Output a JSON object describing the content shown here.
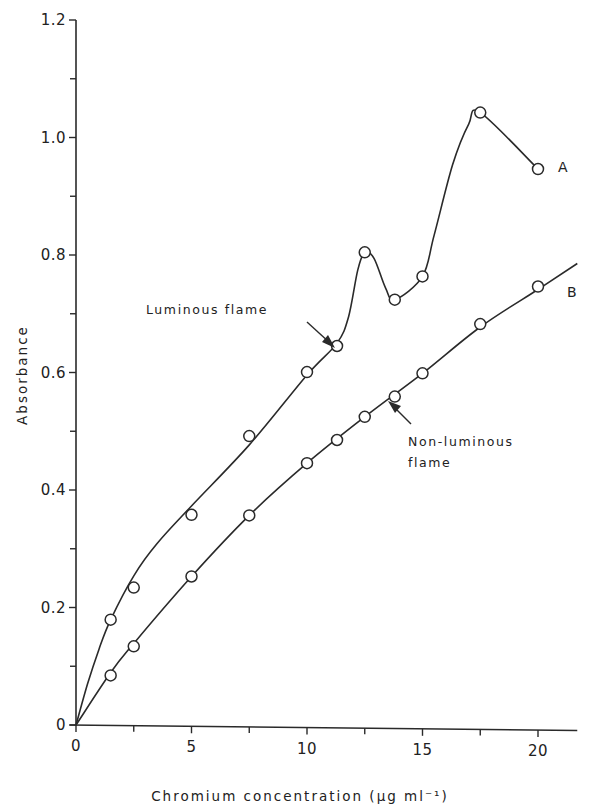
{
  "chart_data": {
    "type": "line",
    "title": "",
    "xlabel": "Chromium concentration (μg ml⁻¹)",
    "ylabel": "Absorbance",
    "xlim": [
      0,
      21.7
    ],
    "ylim": [
      0,
      1.2
    ],
    "x_ticks_major": [
      0,
      5,
      10,
      15,
      20
    ],
    "x_ticks_minor": [
      2.5,
      7.5,
      12.5,
      17.5
    ],
    "y_ticks_major": [
      0,
      0.2,
      0.4,
      0.6,
      0.8,
      1.0,
      1.2
    ],
    "y_tick_labels": [
      "0",
      "0.2",
      "0.4",
      "0.6",
      "0.8",
      "1.0",
      "1.2"
    ],
    "y_ticks_minor": [
      0.1,
      0.3,
      0.5,
      0.7,
      0.9,
      1.1
    ],
    "grid": false,
    "legend": "none (curves labelled directly A and B)",
    "series": [
      {
        "name": "A",
        "description": "Luminous flame",
        "x": [
          1.5,
          2.5,
          5,
          7.5,
          10,
          11.3,
          12.5,
          13.8,
          15,
          17.5,
          20
        ],
        "y": [
          0.18,
          0.235,
          0.36,
          0.495,
          0.605,
          0.65,
          0.81,
          0.73,
          0.77,
          1.05,
          0.955
        ],
        "curve": [
          [
            0,
            0
          ],
          [
            0.5,
            0.07
          ],
          [
            1,
            0.13
          ],
          [
            1.5,
            0.18
          ],
          [
            2.5,
            0.255
          ],
          [
            3.5,
            0.31
          ],
          [
            5,
            0.375
          ],
          [
            7.5,
            0.48
          ],
          [
            10,
            0.6
          ],
          [
            11.3,
            0.655
          ],
          [
            11.8,
            0.7
          ],
          [
            12.2,
            0.78
          ],
          [
            12.5,
            0.81
          ],
          [
            12.9,
            0.8
          ],
          [
            13.4,
            0.75
          ],
          [
            13.8,
            0.73
          ],
          [
            15,
            0.77
          ],
          [
            15.5,
            0.84
          ],
          [
            16.3,
            0.96
          ],
          [
            17,
            1.03
          ],
          [
            17.5,
            1.05
          ],
          [
            20,
            0.955
          ]
        ]
      },
      {
        "name": "B",
        "description": "Non-luminous flame",
        "x": [
          1.5,
          2.5,
          5,
          7.5,
          10,
          11.3,
          12.5,
          13.8,
          15,
          17.5,
          20
        ],
        "y": [
          0.085,
          0.135,
          0.255,
          0.36,
          0.45,
          0.49,
          0.53,
          0.565,
          0.605,
          0.69,
          0.755
        ],
        "curve": [
          [
            0,
            0
          ],
          [
            1.5,
            0.09
          ],
          [
            2.5,
            0.14
          ],
          [
            5,
            0.255
          ],
          [
            7.5,
            0.36
          ],
          [
            10,
            0.45
          ],
          [
            12.5,
            0.53
          ],
          [
            15,
            0.605
          ],
          [
            17.5,
            0.685
          ],
          [
            20,
            0.75
          ],
          [
            21.7,
            0.795
          ]
        ]
      }
    ],
    "annotations": [
      {
        "text": "Luminous flame",
        "points_to_series": "A",
        "at_x": 11.0
      },
      {
        "text": "Non-luminous flame",
        "points_to_series": "B",
        "at_x": 13.2
      }
    ]
  },
  "labels": {
    "series_a": "A",
    "series_b": "B",
    "luminous": "Luminous flame",
    "non_luminous_line1": "Non-luminous",
    "non_luminous_line2": "flame",
    "xlabel": "Chromium concentration (μg ml⁻¹)",
    "ylabel": "Absorbance"
  }
}
